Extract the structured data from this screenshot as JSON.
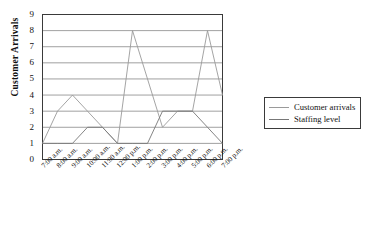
{
  "chart_data": {
    "type": "line",
    "title": "",
    "xlabel": "",
    "ylabel": "Customer Arrivals",
    "categories": [
      "7:00 a.m.",
      "8:00 a.m.",
      "9:00 a.m.",
      "10:00 a.m.",
      "11:00 a.m.",
      "12:00 p.m.",
      "1:00 p.m.",
      "2:00 p.m.",
      "3:00 p.m.",
      "4:00 p.m.",
      "5:00 p.m.",
      "6:00 p.m.",
      "7:00 p.m."
    ],
    "series": [
      {
        "name": "Customer arrivals",
        "values": [
          1,
          3,
          4,
          3,
          2,
          1,
          8,
          5,
          2,
          3,
          3,
          8,
          4
        ],
        "color": "#9a9a9a"
      },
      {
        "name": "Staffing level",
        "values": [
          1,
          1,
          1,
          2,
          2,
          1,
          1,
          1,
          3,
          3,
          3,
          2,
          1
        ],
        "color": "#777777"
      }
    ],
    "ylim": [
      0,
      9
    ],
    "yticks": [
      0,
      1,
      2,
      3,
      4,
      5,
      6,
      7,
      8,
      9
    ],
    "grid": true,
    "legend_position": "right"
  },
  "legend": {
    "entries": [
      {
        "label": "Customer arrivals"
      },
      {
        "label": "Staffing level"
      }
    ]
  },
  "axis": {
    "y_title": "Customer Arrivals"
  },
  "colors": {
    "arrivals": "#9a9a9a",
    "staffing": "#777777",
    "grid": "#888888",
    "frame": "#3a3a3a",
    "text": "#111111"
  }
}
